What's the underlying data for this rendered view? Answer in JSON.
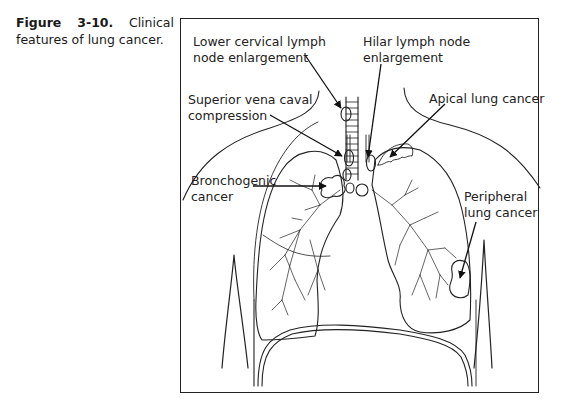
{
  "figure": {
    "number": "Figure 3-10.",
    "caption": "Clinical features of lung cancer.",
    "labels": {
      "lower_cervical_line1": "Lower cervical lymph",
      "lower_cervical_line2": "node enlargement",
      "hilar_line1": "Hilar lymph node",
      "hilar_line2": "enlargement",
      "svc_line1": "Superior vena caval",
      "svc_line2": "compression",
      "apical": "Apical lung cancer",
      "bronchogenic_line1": "Bronchogenic",
      "bronchogenic_line2": "cancer",
      "peripheral_line1": "Peripheral",
      "peripheral_line2": "lung cancer"
    }
  }
}
